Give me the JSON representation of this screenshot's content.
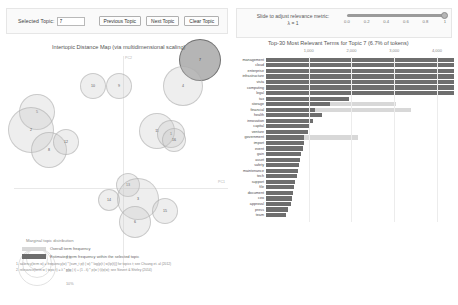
{
  "topic_controls": {
    "selected_topic_label": "Selected Topic:",
    "selected_topic_value": "7",
    "previous_label": "Previous Topic",
    "next_label": "Next Topic",
    "clear_label": "Clear Topic"
  },
  "lambda_controls": {
    "title": "Slide to adjust relevance metric:",
    "lambda_symbol": "λ",
    "value_text": "λ = 1",
    "ticks": [
      "0.0",
      "0.2",
      "0.4",
      "0.6",
      "0.8",
      "1"
    ],
    "handle_position_pct": 100
  },
  "left_panel": {
    "title": "Intertopic Distance Map (via multidimensional scaling)",
    "axis_pc1": "PC1",
    "axis_pc2": "PC2",
    "legend_title": "Marginal topic distribution",
    "legend_sizes": [
      "2%",
      "5%",
      "10%"
    ]
  },
  "right_panel": {
    "title": "Top-30 Most Relevant Terms for Topic 7 (6.7% of tokens)",
    "legend_overall": "Overall term frequency",
    "legend_topic": "Estimated term frequency within the selected topic",
    "footnote_1": "1. saliency(term w) = frequency(w) * [sum_t p(t | w) * log(p(t | w)/p(t))] for topics t; see Chuang et. al (2012)",
    "footnote_2": "2. relevance(term w | topic t) = λ * p(w | t) + (1 - λ) * p(w | t)/p(w); see Sievert & Shirley (2014)"
  },
  "chart_data": {
    "type": "bar",
    "title": "Top-30 Most Relevant Terms for Topic 7 (6.7% of tokens)",
    "xlabel": "",
    "ylabel": "",
    "xlim": [
      0,
      4400
    ],
    "xticks": [
      1000,
      2000,
      3000,
      4000
    ],
    "xtick_labels": [
      "1,000",
      "2,000",
      "3,000",
      "4,000"
    ],
    "grid": true,
    "legend_position": "bottom",
    "orientation": "horizontal",
    "categories": [
      "management",
      "cloud",
      "enterprise",
      "infrastructure",
      "vista",
      "computing",
      "legal",
      "tax",
      "storage",
      "financial",
      "health",
      "innovation",
      "capital",
      "venture",
      "government",
      "import",
      "event",
      "gain",
      "asset",
      "safety",
      "maintenance",
      "tech",
      "support",
      "file",
      "document",
      "ceo",
      "approval",
      "press",
      "team"
    ],
    "series": [
      {
        "name": "Overall term frequency",
        "values": [
          4400,
          4400,
          4400,
          4400,
          4400,
          4400,
          4400,
          1950,
          3050,
          3400,
          1300,
          1100,
          1000,
          980,
          2150,
          900,
          860,
          830,
          800,
          770,
          740,
          720,
          690,
          660,
          640,
          610,
          580,
          520,
          470
        ]
      },
      {
        "name": "Estimated term frequency within the selected topic",
        "values": [
          4400,
          4400,
          4400,
          4400,
          4400,
          4400,
          4400,
          1950,
          1500,
          1150,
          1300,
          1100,
          1000,
          980,
          900,
          900,
          860,
          830,
          800,
          770,
          740,
          720,
          690,
          660,
          640,
          610,
          580,
          520,
          470
        ]
      }
    ]
  },
  "topics": [
    {
      "id": "7",
      "x": 196,
      "y": 8,
      "r": 21,
      "selected": true
    },
    {
      "id": "4",
      "x": 179,
      "y": 34,
      "r": 20,
      "selected": false
    },
    {
      "id": "10",
      "x": 89,
      "y": 34,
      "r": 13,
      "selected": false
    },
    {
      "id": "9",
      "x": 115,
      "y": 34,
      "r": 13,
      "selected": false
    },
    {
      "id": "5",
      "x": 33,
      "y": 60,
      "r": 18,
      "selected": false
    },
    {
      "id": "2",
      "x": 27,
      "y": 78,
      "r": 23,
      "selected": false
    },
    {
      "id": "8",
      "x": 45,
      "y": 98,
      "r": 18,
      "selected": false
    },
    {
      "id": "12",
      "x": 62,
      "y": 90,
      "r": 13,
      "selected": false
    },
    {
      "id": "11",
      "x": 153,
      "y": 79,
      "r": 18,
      "selected": false
    },
    {
      "id": "1",
      "x": 167,
      "y": 82,
      "r": 14,
      "selected": false
    },
    {
      "id": "16",
      "x": 170,
      "y": 88,
      "r": 12,
      "selected": false
    },
    {
      "id": "14",
      "x": 105,
      "y": 148,
      "r": 11,
      "selected": false
    },
    {
      "id": "13",
      "x": 124,
      "y": 133,
      "r": 12,
      "selected": false
    },
    {
      "id": "3",
      "x": 134,
      "y": 147,
      "r": 21,
      "selected": false
    },
    {
      "id": "15",
      "x": 161,
      "y": 159,
      "r": 13,
      "selected": false
    },
    {
      "id": "6",
      "x": 131,
      "y": 170,
      "r": 16,
      "selected": false
    }
  ]
}
